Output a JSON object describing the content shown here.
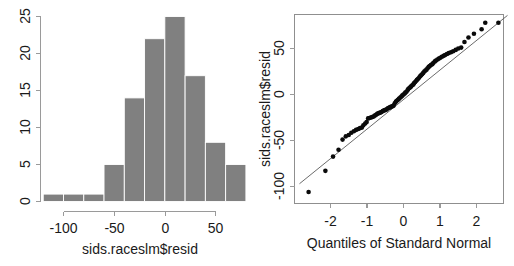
{
  "figure": {
    "background": "#ffffff",
    "panel_count": 2
  },
  "chart_data": [
    {
      "type": "bar",
      "subtype": "histogram",
      "title": "",
      "xlabel": "sids.raceslm$resid",
      "ylabel": "",
      "categories": [
        "-120 to -100",
        "-100 to -80",
        "-80 to -60",
        "-60 to -40",
        "-40 to -20",
        "-20 to 0",
        "0 to 20",
        "20 to 40",
        "40 to 60",
        "60 to 80"
      ],
      "bin_edges": [
        -120,
        -100,
        -80,
        -60,
        -40,
        -20,
        0,
        20,
        40,
        60,
        80
      ],
      "bin_width": 20,
      "values": [
        1,
        1,
        1,
        5,
        14,
        22,
        25,
        17,
        8,
        5
      ],
      "xlim": [
        -120,
        80
      ],
      "ylim": [
        0,
        25
      ],
      "xticks": [
        -100,
        -50,
        0,
        50
      ],
      "xtick_labels": [
        "-100",
        "-50",
        "0",
        "50"
      ],
      "yticks": [
        0,
        5,
        10,
        15,
        20,
        25
      ],
      "ytick_labels": [
        "0",
        "5",
        "10",
        "15",
        "20",
        "25"
      ],
      "bar_color": "#808080",
      "bar_border_color": "#ffffff",
      "grid": false,
      "legend": "none"
    },
    {
      "type": "scatter",
      "subtype": "qq-plot",
      "title": "",
      "xlabel": "Quantiles of Standard Normal",
      "ylabel": "sids.raceslm$resid",
      "xlim": [
        -2.85,
        2.85
      ],
      "ylim": [
        -115,
        90
      ],
      "xticks": [
        -2,
        -1,
        0,
        1,
        2
      ],
      "xtick_labels": [
        "-2",
        "-1",
        "0",
        "1",
        "2"
      ],
      "yticks": [
        -100,
        -50,
        0,
        50
      ],
      "ytick_labels": [
        "-100",
        "-50",
        "0",
        "50"
      ],
      "point_color": "#0a0a0a",
      "line_color": "#5a5a5a",
      "grid": false,
      "legend": "none",
      "frame": "box",
      "reference_line": {
        "description": "qqline through first and third quartiles",
        "x": [
          -2.85,
          2.85
        ],
        "y": [
          -97,
          86
        ]
      },
      "points": [
        [
          -2.6,
          -106.0
        ],
        [
          -2.14,
          -83.0
        ],
        [
          -1.93,
          -67.5
        ],
        [
          -1.78,
          -60.0
        ],
        [
          -1.67,
          -49.0
        ],
        [
          -1.58,
          -45.5
        ],
        [
          -1.5,
          -44.0
        ],
        [
          -1.43,
          -41.5
        ],
        [
          -1.36,
          -40.0
        ],
        [
          -1.3,
          -38.5
        ],
        [
          -1.24,
          -37.5
        ],
        [
          -1.19,
          -36.5
        ],
        [
          -1.14,
          -36.0
        ],
        [
          -1.1,
          -33.5
        ],
        [
          -1.05,
          -31.5
        ],
        [
          -1.01,
          -30.0
        ],
        [
          -0.97,
          -26.0
        ],
        [
          -0.93,
          -25.5
        ],
        [
          -0.89,
          -25.0
        ],
        [
          -0.86,
          -24.5
        ],
        [
          -0.82,
          -24.0
        ],
        [
          -0.79,
          -23.0
        ],
        [
          -0.75,
          -22.0
        ],
        [
          -0.72,
          -21.0
        ],
        [
          -0.69,
          -20.5
        ],
        [
          -0.66,
          -20.0
        ],
        [
          -0.63,
          -19.5
        ],
        [
          -0.6,
          -19.0
        ],
        [
          -0.57,
          -18.0
        ],
        [
          -0.54,
          -17.5
        ],
        [
          -0.51,
          -17.0
        ],
        [
          -0.48,
          -16.5
        ],
        [
          -0.46,
          -16.0
        ],
        [
          -0.43,
          -15.0
        ],
        [
          -0.4,
          -14.5
        ],
        [
          -0.37,
          -14.0
        ],
        [
          -0.35,
          -13.5
        ],
        [
          -0.32,
          -13.0
        ],
        [
          -0.29,
          -12.5
        ],
        [
          -0.27,
          -12.0
        ],
        [
          -0.24,
          -9.5
        ],
        [
          -0.21,
          -8.0
        ],
        [
          -0.19,
          -7.0
        ],
        [
          -0.16,
          -6.0
        ],
        [
          -0.13,
          -5.0
        ],
        [
          -0.11,
          -4.0
        ],
        [
          -0.08,
          -3.0
        ],
        [
          -0.05,
          -2.0
        ],
        [
          -0.03,
          -1.0
        ],
        [
          0.0,
          0.0
        ],
        [
          0.03,
          1.0
        ],
        [
          0.05,
          2.0
        ],
        [
          0.08,
          3.0
        ],
        [
          0.11,
          4.5
        ],
        [
          0.13,
          6.0
        ],
        [
          0.16,
          7.0
        ],
        [
          0.19,
          8.0
        ],
        [
          0.21,
          9.0
        ],
        [
          0.24,
          10.0
        ],
        [
          0.27,
          11.0
        ],
        [
          0.29,
          12.5
        ],
        [
          0.32,
          13.5
        ],
        [
          0.35,
          15.0
        ],
        [
          0.37,
          16.0
        ],
        [
          0.4,
          17.0
        ],
        [
          0.43,
          18.5
        ],
        [
          0.46,
          20.0
        ],
        [
          0.48,
          21.0
        ],
        [
          0.51,
          22.0
        ],
        [
          0.54,
          23.5
        ],
        [
          0.57,
          25.0
        ],
        [
          0.6,
          26.0
        ],
        [
          0.63,
          27.0
        ],
        [
          0.66,
          28.5
        ],
        [
          0.69,
          30.0
        ],
        [
          0.72,
          31.0
        ],
        [
          0.75,
          32.0
        ],
        [
          0.79,
          33.0
        ],
        [
          0.82,
          34.5
        ],
        [
          0.86,
          36.0
        ],
        [
          0.89,
          37.0
        ],
        [
          0.93,
          38.0
        ],
        [
          0.97,
          39.0
        ],
        [
          1.01,
          40.0
        ],
        [
          1.05,
          41.0
        ],
        [
          1.1,
          42.0
        ],
        [
          1.14,
          43.0
        ],
        [
          1.19,
          44.0
        ],
        [
          1.24,
          45.0
        ],
        [
          1.3,
          46.0
        ],
        [
          1.36,
          47.0
        ],
        [
          1.43,
          48.5
        ],
        [
          1.5,
          50.0
        ],
        [
          1.58,
          51.0
        ],
        [
          1.67,
          57.0
        ],
        [
          1.78,
          62.0
        ],
        [
          1.93,
          66.0
        ],
        [
          2.14,
          71.0
        ],
        [
          2.24,
          78.0
        ],
        [
          2.6,
          78.0
        ]
      ]
    }
  ],
  "histogram": {
    "xlabel": "sids.raceslm$resid",
    "ytick_labels": [
      "0",
      "5",
      "10",
      "15",
      "20",
      "25"
    ],
    "xtick_labels": [
      "-100",
      "-50",
      "0",
      "50"
    ]
  },
  "qqplot": {
    "xlabel": "Quantiles of Standard Normal",
    "ylabel": "sids.raceslm$resid",
    "ytick_labels": [
      "-100",
      "-50",
      "0",
      "50"
    ],
    "xtick_labels": [
      "-2",
      "-1",
      "0",
      "1",
      "2"
    ]
  }
}
